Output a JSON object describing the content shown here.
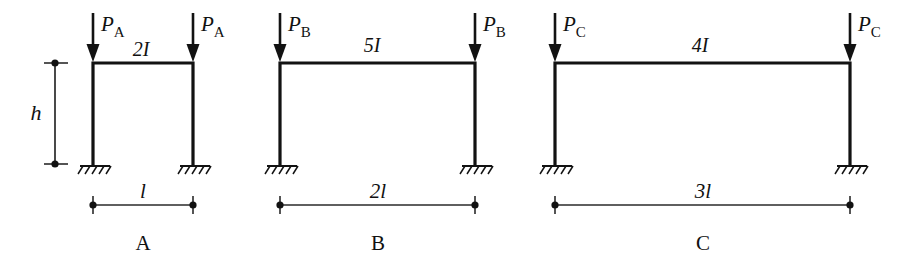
{
  "figure": {
    "background_color": "#ffffff",
    "ink_color": "#121212"
  },
  "height_dimension": {
    "label": "h",
    "name": "column-height"
  },
  "frames": [
    {
      "id": "A",
      "caption": "A",
      "beam_label": "2I",
      "load_symbol": "P",
      "load_subscript": "A",
      "span_label": "l",
      "support_type": "fixed",
      "load_count": 2,
      "left_x": 93,
      "right_x": 193,
      "beam_y": 63,
      "base_y": 164
    },
    {
      "id": "B",
      "caption": "B",
      "beam_label": "5I",
      "load_symbol": "P",
      "load_subscript": "B",
      "span_label": "2l",
      "support_type": "fixed",
      "load_count": 2,
      "left_x": 280,
      "right_x": 475,
      "beam_y": 63,
      "base_y": 164
    },
    {
      "id": "C",
      "caption": "C",
      "beam_label": "4I",
      "load_symbol": "P",
      "load_subscript": "C",
      "span_label": "3l",
      "support_type": "fixed",
      "load_count": 2,
      "left_x": 555,
      "right_x": 850,
      "beam_y": 63,
      "base_y": 164
    }
  ]
}
